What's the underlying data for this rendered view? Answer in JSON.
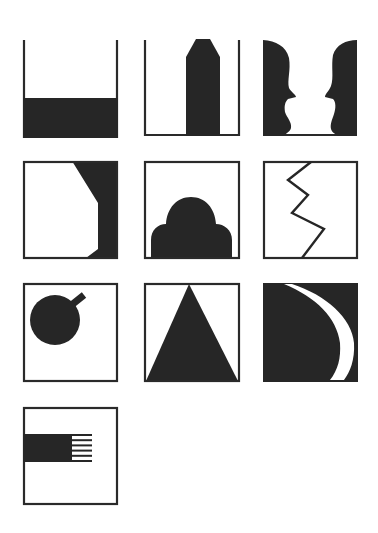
{
  "title": "",
  "figure_grid": {
    "rows": 4,
    "columns": 3,
    "ink_color": "#262626",
    "background_color": "#ffffff",
    "panels": [
      {
        "index": 1,
        "row": 1,
        "col": 1,
        "name": "half-filled-container",
        "description": "Open-top container with lower portion filled black"
      },
      {
        "index": 2,
        "row": 1,
        "col": 2,
        "name": "pencil-in-container",
        "description": "Open-top container with a black pencil-shaped column rising from the floor"
      },
      {
        "index": 3,
        "row": 1,
        "col": 3,
        "name": "facing-profiles",
        "description": "Two black face profiles facing each other (vase/face illusion)"
      },
      {
        "index": 4,
        "row": 2,
        "col": 1,
        "name": "corner-cut-shape",
        "description": "Framed square with black region on the right bounded by angled edges"
      },
      {
        "index": 5,
        "row": 2,
        "col": 2,
        "name": "dome-mound",
        "description": "Framed square with a black dome with two side lobes at the bottom"
      },
      {
        "index": 6,
        "row": 2,
        "col": 3,
        "name": "zigzag-line",
        "description": "Framed square with a zigzag line from top to bottom"
      },
      {
        "index": 7,
        "row": 3,
        "col": 1,
        "name": "circle-with-stem",
        "description": "Framed square with black circle and short diagonal stem (bomb/fruit)"
      },
      {
        "index": 8,
        "row": 3,
        "col": 2,
        "name": "triangle",
        "description": "Framed square with black triangle, apex at top center"
      },
      {
        "index": 9,
        "row": 3,
        "col": 3,
        "name": "crescent-on-black",
        "description": "Black square with a white crescent sweeping from top to bottom right"
      },
      {
        "index": 10,
        "row": 4,
        "col": 1,
        "name": "fringed-bar",
        "description": "Framed square with a black horizontal bar ending in six fringe lines"
      }
    ]
  }
}
